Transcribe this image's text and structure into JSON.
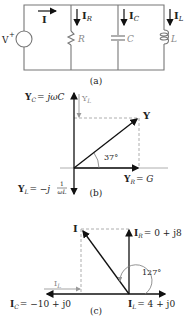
{
  "figure": {
    "panel_a": {
      "caption": "(a)",
      "source_label": "V",
      "source_sign": "+",
      "current_total": "I",
      "branches": [
        {
          "current": "I",
          "current_sub": "R",
          "element": "R"
        },
        {
          "current": "I",
          "current_sub": "C",
          "element": "C"
        },
        {
          "current": "I",
          "current_sub": "L",
          "element": "L"
        }
      ]
    },
    "panel_b": {
      "caption": "(b)",
      "yc_label": "Y",
      "yc_sub": "C",
      "yc_expr": "= jωC",
      "yl_gray_label": "Y",
      "yl_gray_sub": "L",
      "y_label": "Y",
      "angle": "37°",
      "yr_label": "Y",
      "yr_sub": "R",
      "yr_expr": "= G",
      "yl_label": "Y",
      "yl_sub": "L",
      "yl_expr": "= −j",
      "yl_frac_num": "1",
      "yl_frac_den": "ωL"
    },
    "panel_c": {
      "caption": "(c)",
      "i_label": "I",
      "ir_label": "I",
      "ir_sub": "R",
      "ir_expr": "= 0 + j8",
      "angle": "127°",
      "il_gray_label": "I",
      "il_gray_sub": "L",
      "ic_label": "I",
      "ic_sub": "C",
      "ic_expr": "= −10 + j0",
      "il_label": "I",
      "il_sub": "L",
      "il_expr": "= 4 + j0"
    }
  }
}
